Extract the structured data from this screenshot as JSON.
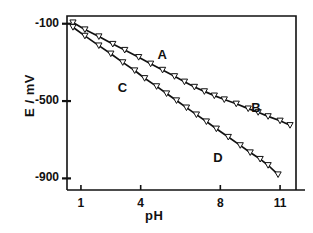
{
  "chart_data": {
    "type": "scatter",
    "title": "",
    "xlabel": "pH",
    "ylabel": "E / mV",
    "xlim": [
      0.3,
      11.8
    ],
    "ylim": [
      -960,
      -60
    ],
    "grid": false,
    "legend_position": "inline-annotations",
    "xticks": [
      1,
      4,
      8,
      11
    ],
    "xtick_labels": [
      "1",
      "4",
      "8",
      "11"
    ],
    "yticks": [
      -100,
      -500,
      -900
    ],
    "ytick_labels": [
      "-100",
      "-500",
      "-900"
    ],
    "annotations": [
      {
        "text": "A",
        "x": 5.1,
        "y": -268
      },
      {
        "text": "B",
        "x": 9.8,
        "y": -543
      },
      {
        "text": "C",
        "x": 3.1,
        "y": -438
      },
      {
        "text": "D",
        "x": 7.9,
        "y": -800
      }
    ],
    "series": [
      {
        "name": "A / B",
        "label_segments": [
          "A",
          "B"
        ],
        "marker": "triangle-down-open",
        "line_style": "solid",
        "color": "#111111",
        "points": [
          {
            "x": 0.6,
            "y": -94
          },
          {
            "x": 1.2,
            "y": -130
          },
          {
            "x": 1.9,
            "y": -166
          },
          {
            "x": 2.6,
            "y": -205
          },
          {
            "x": 3.2,
            "y": -236
          },
          {
            "x": 3.9,
            "y": -273
          },
          {
            "x": 4.5,
            "y": -307
          },
          {
            "x": 5.1,
            "y": -339
          },
          {
            "x": 5.7,
            "y": -372
          },
          {
            "x": 6.2,
            "y": -400
          },
          {
            "x": 6.7,
            "y": -427
          },
          {
            "x": 7.2,
            "y": -450
          },
          {
            "x": 7.7,
            "y": -472
          },
          {
            "x": 8.2,
            "y": -492
          },
          {
            "x": 8.8,
            "y": -514
          },
          {
            "x": 9.4,
            "y": -539
          },
          {
            "x": 9.9,
            "y": -558
          },
          {
            "x": 10.4,
            "y": -579
          },
          {
            "x": 11.0,
            "y": -602
          },
          {
            "x": 11.5,
            "y": -625
          }
        ]
      },
      {
        "name": "C / D",
        "label_segments": [
          "C",
          "D"
        ],
        "marker": "triangle-down-open",
        "line_style": "solid",
        "color": "#111111",
        "points": [
          {
            "x": 0.6,
            "y": -118
          },
          {
            "x": 1.2,
            "y": -163
          },
          {
            "x": 1.9,
            "y": -213
          },
          {
            "x": 2.5,
            "y": -255
          },
          {
            "x": 3.1,
            "y": -300
          },
          {
            "x": 3.7,
            "y": -342
          },
          {
            "x": 4.2,
            "y": -382
          },
          {
            "x": 4.8,
            "y": -424
          },
          {
            "x": 5.3,
            "y": -461
          },
          {
            "x": 5.8,
            "y": -497
          },
          {
            "x": 6.3,
            "y": -534
          },
          {
            "x": 6.8,
            "y": -570
          },
          {
            "x": 7.3,
            "y": -606
          },
          {
            "x": 7.8,
            "y": -643
          },
          {
            "x": 8.4,
            "y": -686
          },
          {
            "x": 9.0,
            "y": -729
          },
          {
            "x": 9.5,
            "y": -766
          },
          {
            "x": 10.0,
            "y": -800
          },
          {
            "x": 10.4,
            "y": -832
          },
          {
            "x": 10.9,
            "y": -880
          }
        ]
      }
    ]
  }
}
